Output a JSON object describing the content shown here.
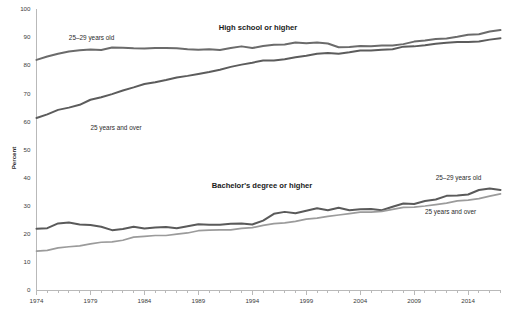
{
  "chart_data": {
    "type": "line",
    "title": "",
    "xlabel": "",
    "ylabel": "Percent",
    "ylim": [
      0,
      100
    ],
    "xlim": [
      1974,
      2017
    ],
    "grid": false,
    "legend_position": "inline-annotations",
    "panel_titles": {
      "top": "High school or higher",
      "bottom": "Bachelor's degree or higher"
    },
    "annotations": [
      {
        "text": "25–29 years old",
        "series": "hs_25_29",
        "x": 1977,
        "y": 89
      },
      {
        "text": "25 years and over",
        "series": "hs_25_over",
        "x": 1979,
        "y": 57
      },
      {
        "text": "25–29 years old",
        "series": "ba_25_29",
        "x": 2011,
        "y": 39
      },
      {
        "text": "25 years and over",
        "series": "ba_25_over",
        "x": 2010,
        "y": 27
      }
    ],
    "y_ticks": [
      0,
      10,
      20,
      30,
      40,
      50,
      60,
      70,
      80,
      90,
      100
    ],
    "x_ticks": [
      1974,
      1979,
      1984,
      1989,
      1994,
      1999,
      2004,
      2009,
      2014
    ],
    "x_minor_step": 1,
    "colors": {
      "hs_25_29": "#6b6b6b",
      "hs_25_over": "#5c5c5c",
      "ba_25_29": "#5a5a5a",
      "ba_25_over": "#9b9b9b",
      "axis": "#b9b9b9",
      "text": "#2b2b2b"
    },
    "x": [
      1974,
      1975,
      1976,
      1977,
      1978,
      1979,
      1980,
      1981,
      1982,
      1983,
      1984,
      1985,
      1986,
      1987,
      1988,
      1989,
      1990,
      1991,
      1992,
      1993,
      1994,
      1995,
      1996,
      1997,
      1998,
      1999,
      2000,
      2001,
      2002,
      2003,
      2004,
      2005,
      2006,
      2007,
      2008,
      2009,
      2010,
      2011,
      2012,
      2013,
      2014,
      2015,
      2016,
      2017
    ],
    "series": [
      {
        "name": "High school or higher, 25–29 years old",
        "key": "hs_25_29",
        "panel": "top",
        "values": [
          81.9,
          83.1,
          84.1,
          84.9,
          85.3,
          85.6,
          85.4,
          86.3,
          86.2,
          86.0,
          85.9,
          86.1,
          86.1,
          86.0,
          85.7,
          85.5,
          85.7,
          85.4,
          86.1,
          86.7,
          86.1,
          86.8,
          87.3,
          87.4,
          88.1,
          87.8,
          88.1,
          87.7,
          86.4,
          86.5,
          86.8,
          86.7,
          87.0,
          87.0,
          87.5,
          88.4,
          88.8,
          89.3,
          89.5,
          90.1,
          90.8,
          91.0,
          92.0,
          92.5
        ]
      },
      {
        "name": "High school or higher, 25 years and over",
        "key": "hs_25_over",
        "panel": "top",
        "values": [
          61.2,
          62.5,
          64.1,
          64.9,
          65.9,
          67.7,
          68.6,
          69.7,
          71.0,
          72.1,
          73.3,
          73.9,
          74.7,
          75.6,
          76.2,
          76.9,
          77.6,
          78.4,
          79.4,
          80.2,
          80.9,
          81.7,
          81.7,
          82.1,
          82.8,
          83.4,
          84.1,
          84.3,
          84.1,
          84.6,
          85.2,
          85.2,
          85.5,
          85.7,
          86.6,
          86.7,
          87.1,
          87.6,
          88.0,
          88.3,
          88.3,
          88.4,
          89.1,
          89.6
        ]
      },
      {
        "name": "Bachelor's degree or higher, 25–29 years old",
        "key": "ba_25_29",
        "panel": "bottom",
        "values": [
          21.8,
          22.0,
          23.7,
          24.0,
          23.3,
          23.1,
          22.5,
          21.3,
          21.7,
          22.5,
          21.9,
          22.2,
          22.4,
          22.0,
          22.7,
          23.4,
          23.2,
          23.2,
          23.6,
          23.7,
          23.3,
          24.7,
          27.1,
          27.8,
          27.3,
          28.2,
          29.1,
          28.4,
          29.3,
          28.4,
          28.7,
          28.8,
          28.4,
          29.6,
          30.8,
          30.6,
          31.7,
          32.2,
          33.5,
          33.6,
          34.0,
          35.6,
          36.1,
          35.6
        ]
      },
      {
        "name": "Bachelor's degree or higher, 25 years and over",
        "key": "ba_25_over",
        "panel": "bottom",
        "values": [
          13.8,
          14.1,
          15.0,
          15.4,
          15.7,
          16.4,
          17.0,
          17.1,
          17.7,
          18.8,
          19.1,
          19.4,
          19.4,
          19.9,
          20.3,
          21.1,
          21.3,
          21.4,
          21.4,
          21.9,
          22.2,
          23.0,
          23.6,
          23.9,
          24.4,
          25.2,
          25.6,
          26.2,
          26.7,
          27.2,
          27.7,
          27.7,
          28.0,
          28.7,
          29.4,
          29.5,
          29.9,
          30.4,
          30.9,
          31.7,
          32.0,
          32.5,
          33.4,
          34.2
        ]
      }
    ]
  }
}
